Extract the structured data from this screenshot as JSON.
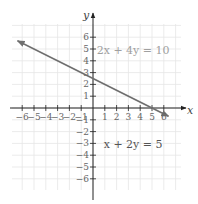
{
  "chart_data": {
    "type": "line",
    "title": "",
    "xlabel": "x",
    "ylabel": "y",
    "xlim": [
      -7,
      7
    ],
    "ylim": [
      -7,
      7
    ],
    "grid": true,
    "x_ticks": [
      -6,
      -5,
      -4,
      -3,
      -2,
      -1,
      1,
      2,
      3,
      4,
      5,
      6
    ],
    "y_ticks": [
      -6,
      -5,
      -4,
      -3,
      -2,
      -1,
      1,
      2,
      3,
      4,
      5,
      6
    ],
    "x_tick_labels": [
      "−6",
      "−5",
      "−4",
      "−3",
      "−2",
      "−1",
      "1",
      "2",
      "3",
      "4",
      "5",
      "6"
    ],
    "y_tick_labels": [
      "−6",
      "−5",
      "−4",
      "−3",
      "−2",
      "−1",
      "1",
      "2",
      "3",
      "4",
      "5",
      "6"
    ],
    "series": [
      {
        "name": "x + 2y = 5",
        "equation": "y = -x/2 + 5/2",
        "slope": -0.5,
        "intercept": 2.5,
        "x": [
          -6.4,
          6.4
        ],
        "y": [
          5.7,
          -0.7
        ],
        "arrows": "both",
        "color": "#6f6f6f"
      }
    ],
    "annotations": [
      {
        "text": "2x + 4y = 10",
        "x": 3.4,
        "y": 4.6,
        "color": "#a0a0a0"
      },
      {
        "text": "x + 2y = 5",
        "x": 3.4,
        "y": -3.4,
        "color": "#555555"
      }
    ]
  },
  "colors": {
    "grid": "#e6e6e6",
    "axis": "#222222",
    "line": "#6f6f6f"
  }
}
